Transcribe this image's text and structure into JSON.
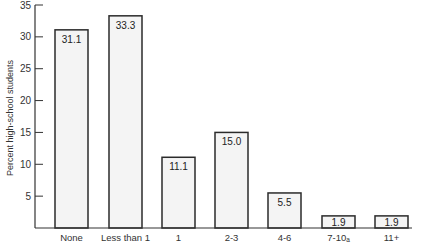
{
  "chart_data": {
    "type": "bar",
    "title": "",
    "xlabel": "",
    "ylabel": "Percent high-school students",
    "ylim": [
      0,
      35
    ],
    "yticks": [
      5,
      10,
      15,
      20,
      25,
      30,
      35
    ],
    "grid": false,
    "legend": null,
    "categories": [
      "None",
      "Less than 1",
      "1",
      "2-3",
      "4-6",
      "7-10",
      "11+"
    ],
    "category_labels_display": [
      "None",
      "Less than 1",
      "1",
      "2-3",
      "4-6",
      "7-10ₐ",
      "11+"
    ],
    "values": [
      31.1,
      33.3,
      11.1,
      15.0,
      5.5,
      1.9,
      1.9
    ],
    "value_labels": [
      "31.1",
      "33.3",
      "11.1",
      "15.0",
      "5.5",
      "1.9",
      "1.9"
    ],
    "colors": {
      "bar_fill": "#f4f4f4",
      "bar_stroke": "#2b2b2b",
      "axis": "#333333"
    }
  }
}
